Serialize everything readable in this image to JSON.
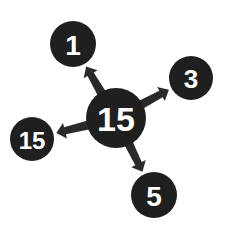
{
  "diagram": {
    "type": "hub-and-spoke",
    "colors": {
      "node_fill": "#1f1f1f",
      "node_text": "#ffffff",
      "arrow": "#2a2a2a",
      "background": "#ffffff"
    },
    "center": {
      "label": "15",
      "cx": 116,
      "cy": 118,
      "r": 30,
      "font_size": 34
    },
    "satellites": [
      {
        "id": "top-left",
        "label": "1",
        "cx": 73,
        "cy": 44,
        "r": 23,
        "font_size": 28
      },
      {
        "id": "right",
        "label": "3",
        "cx": 191,
        "cy": 78,
        "r": 22,
        "font_size": 26
      },
      {
        "id": "left",
        "label": "15",
        "cx": 32,
        "cy": 139,
        "r": 22,
        "font_size": 24
      },
      {
        "id": "bottom",
        "label": "5",
        "cx": 154,
        "cy": 195,
        "r": 23,
        "font_size": 28
      }
    ],
    "edges": [
      {
        "from": "center",
        "to": "top-left",
        "direction": "center-to-satellite"
      },
      {
        "from": "center",
        "to": "right",
        "direction": "center-to-satellite"
      },
      {
        "from": "center",
        "to": "left",
        "direction": "center-to-satellite"
      },
      {
        "from": "center",
        "to": "bottom",
        "direction": "center-to-satellite"
      }
    ]
  }
}
